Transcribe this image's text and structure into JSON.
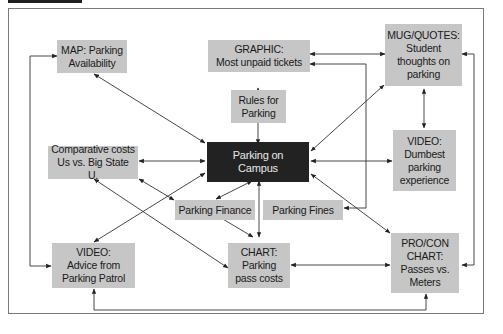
{
  "diagram": {
    "center": {
      "label": "Parking on\nCampus"
    },
    "nodes": {
      "map": {
        "label": "MAP: Parking\nAvailability"
      },
      "graphic": {
        "label": "GRAPHIC:\nMost unpaid tickets"
      },
      "mug": {
        "label": "MUG/QUOTES:\nStudent\nthoughts on\nparking"
      },
      "rules": {
        "label": "Rules for\nParking"
      },
      "comparative": {
        "label": "Comparative costs\nUs vs. Big State U."
      },
      "video_dumb": {
        "label": "VIDEO:\nDumbest\nparking\nexperience"
      },
      "finance": {
        "label": "Parking Finance"
      },
      "fines": {
        "label": "Parking Fines"
      },
      "video_patrol": {
        "label": "VIDEO:\nAdvice from\nParking Patrol"
      },
      "chart": {
        "label": "CHART:\nParking\npass costs"
      },
      "procon": {
        "label": "PRO/CON\nCHART:\nPasses vs.\nMeters"
      }
    }
  }
}
